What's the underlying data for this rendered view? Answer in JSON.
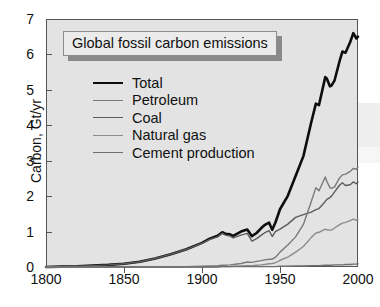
{
  "chart_data": {
    "type": "line",
    "title": "Global fossil carbon emissions",
    "xlabel": "",
    "ylabel": "Carbon, Gt/yr",
    "xlim": [
      1800,
      2000
    ],
    "ylim": [
      0,
      7
    ],
    "xticks": [
      1800,
      1850,
      1900,
      1950,
      2000
    ],
    "yticks": [
      0,
      1,
      2,
      3,
      4,
      5,
      6,
      7
    ],
    "grid": false,
    "legend_position": "upper-left",
    "x": [
      1800,
      1810,
      1820,
      1830,
      1840,
      1850,
      1860,
      1870,
      1880,
      1890,
      1900,
      1905,
      1910,
      1913,
      1915,
      1918,
      1920,
      1925,
      1929,
      1932,
      1935,
      1938,
      1940,
      1943,
      1945,
      1947,
      1950,
      1955,
      1960,
      1965,
      1970,
      1973,
      1975,
      1979,
      1980,
      1982,
      1983,
      1985,
      1988,
      1990,
      1992,
      1995,
      1997,
      1999,
      2000
    ],
    "series": [
      {
        "name": "Total",
        "color": "#0d0d0d",
        "width": 2.6,
        "values": [
          0.0,
          0.01,
          0.02,
          0.04,
          0.06,
          0.09,
          0.15,
          0.24,
          0.36,
          0.5,
          0.68,
          0.8,
          0.88,
          0.98,
          0.94,
          0.92,
          0.88,
          1.0,
          1.06,
          0.87,
          0.96,
          1.1,
          1.18,
          1.25,
          1.05,
          1.25,
          1.63,
          2.01,
          2.57,
          3.13,
          4.08,
          4.61,
          4.57,
          5.36,
          5.32,
          5.1,
          5.12,
          5.27,
          5.78,
          6.08,
          6.05,
          6.35,
          6.6,
          6.45,
          6.5
        ]
      },
      {
        "name": "Coal",
        "color": "#5c5c5c",
        "width": 1.4,
        "values": [
          0.0,
          0.01,
          0.02,
          0.04,
          0.06,
          0.09,
          0.15,
          0.24,
          0.36,
          0.5,
          0.67,
          0.78,
          0.85,
          0.95,
          0.9,
          0.87,
          0.82,
          0.9,
          0.95,
          0.73,
          0.8,
          0.9,
          0.96,
          1.03,
          0.86,
          1.0,
          1.07,
          1.21,
          1.4,
          1.48,
          1.55,
          1.62,
          1.65,
          1.85,
          1.91,
          1.96,
          2.0,
          2.12,
          2.3,
          2.38,
          2.3,
          2.32,
          2.4,
          2.35,
          2.4
        ]
      },
      {
        "name": "Petroleum",
        "color": "#7a7a7a",
        "width": 1.4,
        "values": [
          0.0,
          0.0,
          0.0,
          0.0,
          0.0,
          0.0,
          0.0,
          0.0,
          0.0,
          0.01,
          0.02,
          0.03,
          0.04,
          0.05,
          0.05,
          0.06,
          0.07,
          0.1,
          0.14,
          0.13,
          0.16,
          0.18,
          0.2,
          0.22,
          0.22,
          0.27,
          0.42,
          0.62,
          0.85,
          1.2,
          1.84,
          2.24,
          2.15,
          2.54,
          2.42,
          2.24,
          2.22,
          2.26,
          2.5,
          2.6,
          2.62,
          2.7,
          2.78,
          2.76,
          2.82
        ]
      },
      {
        "name": "Natural gas",
        "color": "#8c8c8c",
        "width": 1.4,
        "values": [
          0.0,
          0.0,
          0.0,
          0.0,
          0.0,
          0.0,
          0.0,
          0.0,
          0.0,
          0.0,
          0.0,
          0.0,
          0.01,
          0.01,
          0.01,
          0.01,
          0.02,
          0.03,
          0.04,
          0.04,
          0.05,
          0.06,
          0.07,
          0.09,
          0.1,
          0.12,
          0.19,
          0.28,
          0.42,
          0.58,
          0.83,
          0.96,
          0.98,
          1.07,
          1.05,
          1.04,
          1.04,
          1.1,
          1.19,
          1.24,
          1.26,
          1.31,
          1.35,
          1.32,
          1.35
        ]
      },
      {
        "name": "Cement production",
        "color": "#6e6e6e",
        "width": 1.4,
        "values": [
          0.0,
          0.0,
          0.0,
          0.0,
          0.0,
          0.0,
          0.0,
          0.0,
          0.0,
          0.0,
          0.0,
          0.0,
          0.0,
          0.01,
          0.01,
          0.01,
          0.01,
          0.01,
          0.01,
          0.01,
          0.01,
          0.01,
          0.01,
          0.01,
          0.01,
          0.01,
          0.02,
          0.02,
          0.03,
          0.03,
          0.04,
          0.04,
          0.04,
          0.05,
          0.05,
          0.05,
          0.05,
          0.06,
          0.06,
          0.06,
          0.07,
          0.07,
          0.08,
          0.08,
          0.09
        ]
      }
    ]
  },
  "axes": {
    "y_title": "Carbon, Gt/yr",
    "y_tick_labels": [
      "7",
      "6",
      "5",
      "4",
      "3",
      "2",
      "1",
      "0"
    ],
    "x_tick_labels": [
      "1800",
      "1850",
      "1900",
      "1950",
      "2000"
    ]
  },
  "title_box": {
    "text": "Global fossil carbon emissions"
  },
  "legend": {
    "items": [
      {
        "label": "Total"
      },
      {
        "label": "Petroleum"
      },
      {
        "label": "Coal"
      },
      {
        "label": "Natural gas"
      },
      {
        "label": "Cement production"
      }
    ]
  },
  "colors": {
    "plot_background": "#e3e3e3",
    "figure_background": "#ffffff",
    "axis": "#555555",
    "text": "#111111",
    "total": "#0d0d0d",
    "petroleum": "#7a7a7a",
    "coal": "#5c5c5c",
    "natural_gas": "#8c8c8c",
    "cement": "#6e6e6e"
  }
}
